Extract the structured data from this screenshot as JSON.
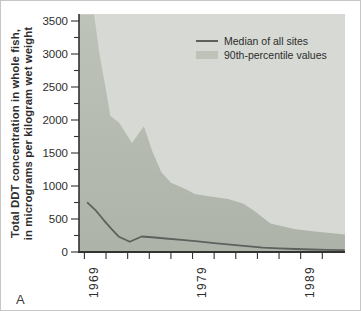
{
  "figure": {
    "panel_label": "A",
    "colors": {
      "page_bg": "#ffffff",
      "border": "#c6c6c6",
      "panel_bg": "#d6d9d4",
      "area_fill_top": "#bec3b9",
      "area_fill_bottom": "#aeb3a9",
      "median_line": "#5c615d",
      "axis": "#323232",
      "text": "#2d2d2d"
    }
  },
  "legend": {
    "items": [
      {
        "label": "Median of all sites",
        "swatch": "line"
      },
      {
        "label": "90th-percentile values",
        "swatch": "area"
      }
    ]
  },
  "chart_data": {
    "type": "area",
    "title": "",
    "xlabel": "",
    "ylabel": "Total DDT concentration in whole fish, in micrograms per kilogram wet weight",
    "ylabel_line1": "Total DDT concentration in whole fish,",
    "ylabel_line2": "in micrograms per kilogram wet weight",
    "x_axis": {
      "min": 1968.5,
      "max": 1993.1,
      "tick_start": 1969,
      "tick_end": 1991,
      "tick_step": 2,
      "labeled_ticks": [
        1969,
        1979,
        1989
      ]
    },
    "y_axis": {
      "min": 0,
      "max": 3500,
      "major_tick_step": 500,
      "minor_tick_step": 250
    },
    "series": [
      {
        "name": "Median of all sites",
        "type": "line",
        "points": [
          [
            1969.3,
            745
          ],
          [
            1970,
            640
          ],
          [
            1970.8,
            480
          ],
          [
            1971.5,
            350
          ],
          [
            1972.2,
            230
          ],
          [
            1973.2,
            155
          ],
          [
            1974.3,
            235
          ],
          [
            1975.5,
            220
          ],
          [
            1976.5,
            205
          ],
          [
            1978,
            185
          ],
          [
            1979.5,
            160
          ],
          [
            1981,
            135
          ],
          [
            1982.5,
            110
          ],
          [
            1984,
            90
          ],
          [
            1985.5,
            65
          ],
          [
            1987,
            55
          ],
          [
            1988.5,
            45
          ],
          [
            1990,
            38
          ],
          [
            1991.5,
            32
          ],
          [
            1993,
            28
          ]
        ]
      },
      {
        "name": "90th-percentile values",
        "type": "area",
        "points": [
          [
            1968.5,
            3600
          ],
          [
            1969.9,
            3600
          ],
          [
            1970.4,
            3000
          ],
          [
            1971.0,
            2450
          ],
          [
            1971.4,
            2060
          ],
          [
            1972.2,
            1960
          ],
          [
            1973.4,
            1650
          ],
          [
            1974.5,
            1905
          ],
          [
            1975.3,
            1520
          ],
          [
            1976.1,
            1210
          ],
          [
            1977,
            1050
          ],
          [
            1978.4,
            950
          ],
          [
            1979.2,
            880
          ],
          [
            1980.5,
            845
          ],
          [
            1982.3,
            805
          ],
          [
            1983.7,
            730
          ],
          [
            1984.7,
            625
          ],
          [
            1986.2,
            430
          ],
          [
            1988.4,
            350
          ],
          [
            1990.3,
            312
          ],
          [
            1991.5,
            292
          ],
          [
            1993.1,
            265
          ]
        ]
      }
    ]
  }
}
